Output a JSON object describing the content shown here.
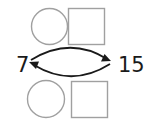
{
  "diagram": {
    "type": "number-relation",
    "left_number": "7",
    "right_number": "15",
    "top_blanks": [
      {
        "shape": "circle",
        "value": ""
      },
      {
        "shape": "square",
        "value": ""
      }
    ],
    "bottom_blanks": [
      {
        "shape": "circle",
        "value": ""
      },
      {
        "shape": "square",
        "value": ""
      }
    ],
    "arrows": [
      {
        "from": "7",
        "to": "15",
        "direction": "forward"
      },
      {
        "from": "15",
        "to": "7",
        "direction": "backward"
      }
    ],
    "colors": {
      "text": "#1a1a1a",
      "arrow": "#1a1a1a",
      "blank_outline": "#a0a0a0"
    }
  }
}
